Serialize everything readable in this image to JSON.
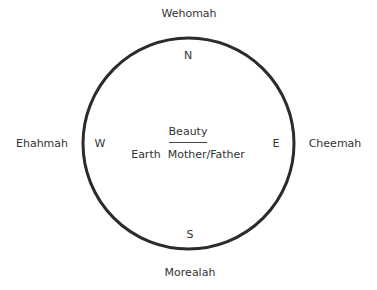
{
  "diagram": {
    "outer_labels": {
      "north": "Wehomah",
      "west": "Ehahmah",
      "east": "Cheemah",
      "south": "Morealah"
    },
    "inner_labels": {
      "north": "N",
      "west": "W",
      "east": "E",
      "south": "S"
    },
    "center": {
      "top": "Beauty",
      "bottom": "Earth  Mother/Father"
    },
    "circle_color": "#2b2b2b"
  }
}
